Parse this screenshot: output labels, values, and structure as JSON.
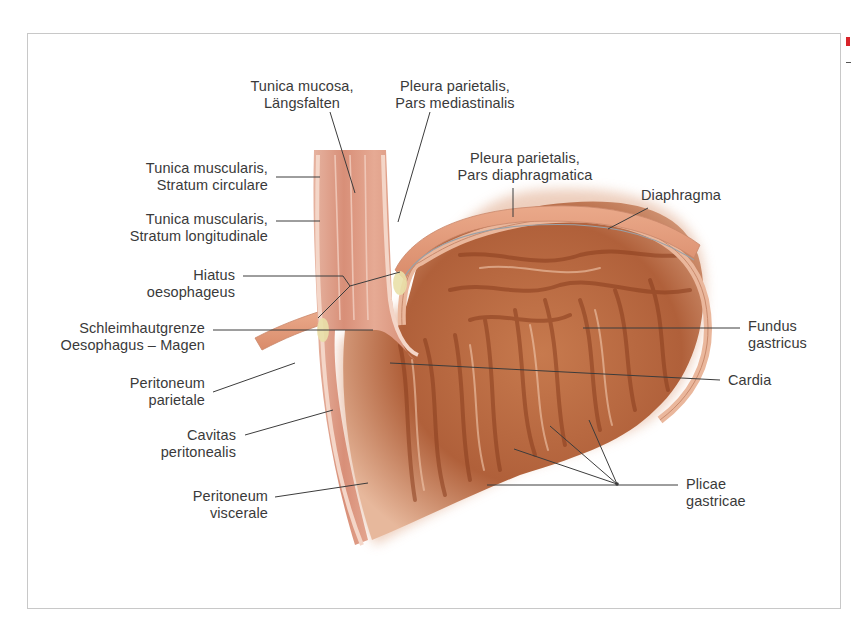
{
  "figure": {
    "labels": {
      "tunica_mucosa": [
        "Tunica mucosa,",
        "Längsfalten"
      ],
      "pleura_mediastinalis": [
        "Pleura parietalis,",
        "Pars mediastinalis"
      ],
      "pleura_diaphragmatica": [
        "Pleura parietalis,",
        "Pars diaphragmatica"
      ],
      "diaphragma": [
        "Diaphragma"
      ],
      "stratum_circulare": [
        "Tunica muscularis,",
        "Stratum circulare"
      ],
      "stratum_longitudinale": [
        "Tunica muscularis,",
        "Stratum longitudinale"
      ],
      "hiatus": [
        "Hiatus",
        "oesophageus"
      ],
      "schleimhautgrenze": [
        "Schleimhautgrenze",
        "Oesophagus – Magen"
      ],
      "fundus": [
        "Fundus",
        "gastricus"
      ],
      "cardia": [
        "Cardia"
      ],
      "peritoneum_parietale": [
        "Peritoneum",
        "parietale"
      ],
      "cavitas": [
        "Cavitas",
        "peritonealis"
      ],
      "peritoneum_viscerale": [
        "Peritoneum",
        "viscerale"
      ],
      "plicae": [
        "Plicae",
        "gastricae"
      ]
    },
    "colors": {
      "leader_line": "#3c3c3c",
      "mucosa": "#e2a08a",
      "stomach_dark": "#a4532c",
      "stomach_mid": "#c47348",
      "diaphragm": "#e8a584",
      "frame_border": "#c8c8c8",
      "accent_mark": "#d8242a"
    }
  }
}
